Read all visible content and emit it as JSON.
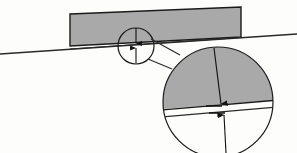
{
  "figure": {
    "type": "technical-diagram",
    "canvas": {
      "width": 297,
      "height": 153
    },
    "background_color": "#fdfdfc"
  },
  "colors": {
    "fill_gray": "#a9a9a9",
    "fill_gray_light": "#b2b2b2",
    "stroke_dark": "#1a1a1a",
    "stroke_medium": "#3b3b3b",
    "stroke_thin": "#555555",
    "background": "#fdfdfc"
  },
  "incline": {
    "label": "inclined ground line",
    "x1": 0,
    "y1": 54,
    "x2": 297,
    "y2": 34,
    "stroke_width": 1.3
  },
  "block": {
    "label": "gray rectangular block",
    "fill": "#a9a9a9",
    "stroke": "#1a1a1a",
    "stroke_width": 1.4,
    "points": "70,14 241,7 241,37 70,46"
  },
  "detail_circle_small": {
    "label": "detail indicator circle",
    "cx": 136,
    "cy": 46,
    "r": 18,
    "stroke": "#1a1a1a",
    "stroke_width": 1.2,
    "fill": "none"
  },
  "small_arrow_top": {
    "label": "downward dimension arrow (small detail)",
    "x1": 136,
    "y1": 27,
    "x2": 136,
    "y2": 44
  },
  "small_arrow_bottom": {
    "label": "upward dimension arrow (small detail)",
    "x1": 136,
    "y1": 64,
    "x2": 136,
    "y2": 47
  },
  "leader_lines": [
    {
      "label": "upper leader line",
      "x1": 151,
      "y1": 40,
      "x2": 178,
      "y2": 53
    },
    {
      "label": "lower leader line",
      "x1": 149,
      "y1": 59,
      "x2": 174,
      "y2": 66
    }
  ],
  "magnified_circle": {
    "label": "magnified detail view circle",
    "cx": 218,
    "cy": 102,
    "r": 55,
    "stroke": "#1a1a1a",
    "stroke_width": 1.2
  },
  "magnified_shaded_region": {
    "label": "magnified gray block region",
    "fill": "#a9a9a9",
    "stroke": "#1a1a1a",
    "stroke_width": 1.3,
    "description": "upper portion of magnified circle filled gray, bounded below by block underside line"
  },
  "magnified_block_line": {
    "label": "block underside line in magnification",
    "x1": 164,
    "y1": 110,
    "x2": 272,
    "y2": 101
  },
  "magnified_incline_line": {
    "label": "incline surface line in magnification",
    "x1": 164,
    "y1": 117,
    "x2": 272,
    "y2": 108
  },
  "magnified_arrow_upper": {
    "label": "upper dimension arrow in magnification",
    "x1": 215,
    "y1": 48,
    "x2": 221,
    "y2": 106
  },
  "magnified_arrow_lower": {
    "label": "lower dimension arrow in magnification",
    "x1": 225,
    "y1": 153,
    "x2": 224,
    "y2": 113
  },
  "magnified_tick_upper": {
    "label": "upper short tick mark",
    "x1": 206,
    "y1": 106,
    "x2": 221,
    "y2": 106
  },
  "magnified_tick_lower": {
    "label": "lower short tick mark",
    "x1": 208,
    "y1": 113,
    "x2": 224,
    "y2": 113
  }
}
